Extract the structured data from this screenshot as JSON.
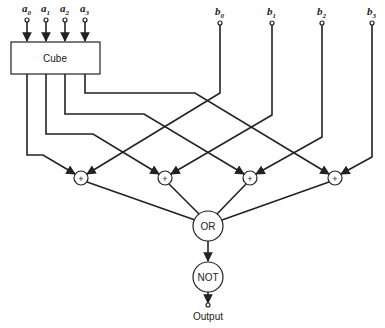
{
  "diagram": {
    "inputs_a": [
      {
        "name": "a",
        "sub": "0",
        "x": 27
      },
      {
        "name": "a",
        "sub": "1",
        "x": 46
      },
      {
        "name": "a",
        "sub": "2",
        "x": 65
      },
      {
        "name": "a",
        "sub": "3",
        "x": 85
      }
    ],
    "inputs_b": [
      {
        "name": "b",
        "sub": "0",
        "x": 220
      },
      {
        "name": "b",
        "sub": "1",
        "x": 272
      },
      {
        "name": "b",
        "sub": "2",
        "x": 322
      },
      {
        "name": "b",
        "sub": "3",
        "x": 372
      }
    ],
    "cube_label": "Cube",
    "adder_symbol": "+",
    "adders": [
      {
        "x": 81,
        "y": 178
      },
      {
        "x": 165,
        "y": 178
      },
      {
        "x": 250,
        "y": 178
      },
      {
        "x": 335,
        "y": 178
      }
    ],
    "or_label": "OR",
    "not_label": "NOT",
    "output_label": "Output",
    "connections": [
      {
        "from": "Cube a0",
        "to": "adder 1"
      },
      {
        "from": "Cube a1",
        "to": "adder 2"
      },
      {
        "from": "Cube a2",
        "to": "adder 3"
      },
      {
        "from": "Cube a3",
        "to": "adder 4"
      },
      {
        "from": "b0",
        "to": "adder 1"
      },
      {
        "from": "b1",
        "to": "adder 2"
      },
      {
        "from": "b2",
        "to": "adder 3"
      },
      {
        "from": "b3",
        "to": "adder 4"
      },
      {
        "from": "adders",
        "to": "OR"
      },
      {
        "from": "OR",
        "to": "NOT"
      },
      {
        "from": "NOT",
        "to": "Output"
      }
    ]
  }
}
